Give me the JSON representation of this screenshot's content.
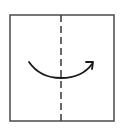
{
  "diagram": {
    "type": "fold-instruction",
    "colors": {
      "outline": "#555555",
      "fold_line": "#444444",
      "arrow": "#1a1a1a",
      "background": "#ffffff"
    },
    "square": {
      "x": 10,
      "y": 15,
      "width": 104,
      "height": 106
    },
    "fold_line": {
      "x": 61,
      "style": "dashed"
    },
    "arrow": {
      "direction": "left-to-right",
      "start": [
        29,
        62
      ],
      "end": [
        93,
        63
      ]
    }
  }
}
